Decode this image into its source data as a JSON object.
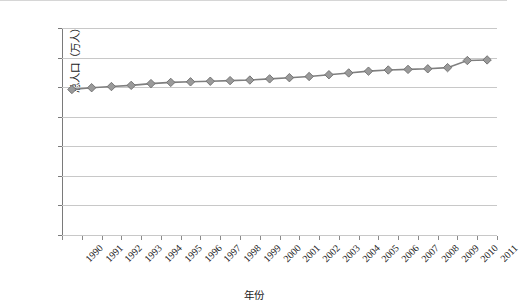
{
  "chart_data": {
    "type": "line",
    "title": "",
    "xlabel": "年份",
    "ylabel": "总人口（万人）",
    "categories": [
      "1990",
      "1991",
      "1992",
      "1993",
      "1994",
      "1995",
      "1996",
      "1997",
      "1998",
      "1999",
      "2000",
      "2001",
      "2002",
      "2003",
      "2004",
      "2005",
      "2006",
      "2007",
      "2008",
      "2009",
      "2010",
      "2011"
    ],
    "values": [
      246,
      249,
      251,
      253,
      256,
      258,
      259,
      260,
      261,
      262,
      264,
      266,
      268,
      271,
      274,
      277,
      279,
      280,
      281,
      283,
      295,
      296
    ],
    "series": [
      {
        "name": "总人口",
        "values": [
          246,
          249,
          251,
          253,
          256,
          258,
          259,
          260,
          261,
          262,
          264,
          266,
          268,
          271,
          274,
          277,
          279,
          280,
          281,
          283,
          295,
          296
        ]
      }
    ],
    "ylim": [
      0,
      350
    ],
    "y_ticks": [
      0,
      50,
      100,
      150,
      200,
      250,
      300,
      350
    ],
    "grid": true,
    "legend": "none",
    "marker": "diamond",
    "series_color": "#7f7f7f",
    "marker_fill": "#9a9a9a",
    "gridline_color": "#c8c8c8",
    "background": "#ffffff",
    "x_tick_rotation": -45
  }
}
